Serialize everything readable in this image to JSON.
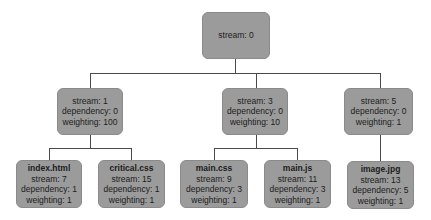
{
  "diagram": {
    "type": "tree",
    "title": "",
    "root": {
      "stream": "stream: 0"
    },
    "level1": [
      {
        "stream": "stream: 1",
        "dependency": "dependency: 0",
        "weighting": "weighting: 100"
      },
      {
        "stream": "stream: 3",
        "dependency": "dependency: 0",
        "weighting": "weighting: 10"
      },
      {
        "stream": "stream: 5",
        "dependency": "dependency: 0",
        "weighting": "weighting: 1"
      }
    ],
    "leaves": [
      {
        "name": "index.html",
        "stream": "stream: 7",
        "dependency": "dependency: 1",
        "weighting": "weighting: 1"
      },
      {
        "name": "critical.css",
        "stream": "stream: 15",
        "dependency": "dependency: 1",
        "weighting": "weighting: 1"
      },
      {
        "name": "main.css",
        "stream": "stream: 9",
        "dependency": "dependency: 3",
        "weighting": "weighting: 1"
      },
      {
        "name": "main.js",
        "stream": "stream: 11",
        "dependency": "dependency: 3",
        "weighting": "weighting: 1"
      },
      {
        "name": "image.jpg",
        "stream": "stream: 13",
        "dependency": "dependency: 5",
        "weighting": "weighting: 1"
      }
    ],
    "colors": {
      "node_fill": "#9b9b9b",
      "line": "#4a4a4a"
    }
  }
}
